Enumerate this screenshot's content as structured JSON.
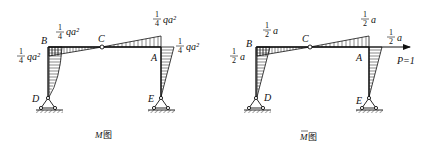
{
  "diagrams": [
    {
      "caption": "M图",
      "caption_symbol": "M",
      "caption_suffix": "图",
      "overbar": false,
      "nodes": {
        "B": "B",
        "C": "C",
        "A": "A",
        "D": "D",
        "E": "E"
      },
      "values": {
        "B_beam": {
          "num": "1",
          "den": "4",
          "tail": "qa²"
        },
        "B_col": {
          "num": "1",
          "den": "4",
          "tail": "qa²"
        },
        "A_beam": {
          "num": "1",
          "den": "4",
          "tail": "qa²"
        },
        "A_col": {
          "num": "1",
          "den": "4",
          "tail": "qa²"
        }
      }
    },
    {
      "caption": "M̄图",
      "caption_symbol": "M",
      "caption_suffix": "图",
      "overbar": true,
      "nodes": {
        "B": "B",
        "C": "C",
        "A": "A",
        "D": "D",
        "E": "E"
      },
      "values": {
        "B_beam": {
          "num": "1",
          "den": "2",
          "tail": "a"
        },
        "B_col": {
          "num": "1",
          "den": "2",
          "tail": "a"
        },
        "A_beam": {
          "num": "1",
          "den": "2",
          "tail": "a"
        },
        "A_col": {
          "num": "1",
          "den": "2",
          "tail": "a"
        }
      },
      "load": "P=1"
    }
  ]
}
